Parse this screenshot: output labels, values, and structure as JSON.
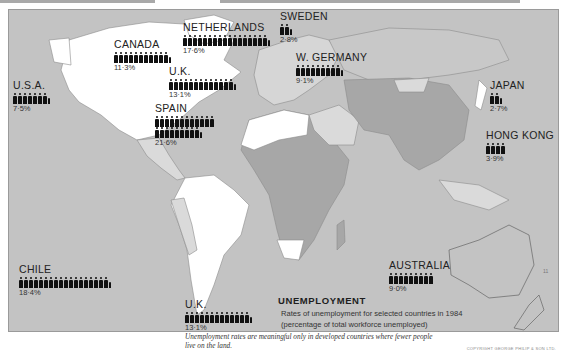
{
  "map": {
    "title": "UNEMPLOYMENT",
    "description_line1": "Rates of unemployment for selected countries in 1984",
    "description_line2": "(percentage of total workforce unemployed)",
    "note_line1": "Unemployment rates are meaningful only in developed countries where fewer people",
    "note_line2": "live on the land.",
    "copyright": "COPYRIGHT GEORGE PHILIP & SON LTD.",
    "page_marker": "11",
    "colors": {
      "ocean": "#c3c3c3",
      "developed_land": "#ffffff",
      "light_land": "#dadada",
      "dark_land": "#a7a7a7",
      "ink": "#111111"
    },
    "countries": [
      {
        "name": "U.S.A.",
        "value": "7·5%",
        "whole_figures": 7,
        "partial": true
      },
      {
        "name": "CANADA",
        "value": "11·3%",
        "whole_figures": 11,
        "partial": true
      },
      {
        "name": "NETHERLANDS",
        "value": "17·6%",
        "whole_figures": 17,
        "partial": true
      },
      {
        "name": "SWEDEN",
        "value": "2·8%",
        "whole_figures": 2,
        "partial": true
      },
      {
        "name": "U.K.",
        "value": "13·1%",
        "whole_figures": 13,
        "partial": true
      },
      {
        "name": "W. GERMANY",
        "value": "9·1%",
        "whole_figures": 9,
        "partial": true
      },
      {
        "name": "SPAIN",
        "value": "21·6%",
        "whole_figures": 21,
        "partial": true
      },
      {
        "name": "JAPAN",
        "value": "2·7%",
        "whole_figures": 2,
        "partial": true
      },
      {
        "name": "HONG KONG",
        "value": "3·9%",
        "whole_figures": 4,
        "partial": false
      },
      {
        "name": "CHILE",
        "value": "18·4%",
        "whole_figures": 18,
        "partial": true
      },
      {
        "name": "AUSTRALIA",
        "value": "9·0%",
        "whole_figures": 9,
        "partial": false
      },
      {
        "name": "U.K.",
        "value": "13·1%",
        "whole_figures": 13,
        "partial": true
      }
    ]
  }
}
